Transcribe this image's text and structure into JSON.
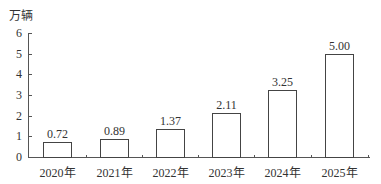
{
  "chart_data": {
    "type": "bar",
    "title": "",
    "xlabel": "",
    "ylabel": "万辆",
    "categories": [
      "2020年",
      "2021年",
      "2022年",
      "2023年",
      "2024年",
      "2025年"
    ],
    "values": [
      0.72,
      0.89,
      1.37,
      2.11,
      3.25,
      5.0
    ],
    "value_labels": [
      "0.72",
      "0.89",
      "1.37",
      "2.11",
      "3.25",
      "5.00"
    ],
    "ylim": [
      0,
      6
    ],
    "yticks": [
      "0",
      "1",
      "2",
      "3",
      "4",
      "5",
      "6"
    ],
    "grid": false,
    "legend": null
  }
}
